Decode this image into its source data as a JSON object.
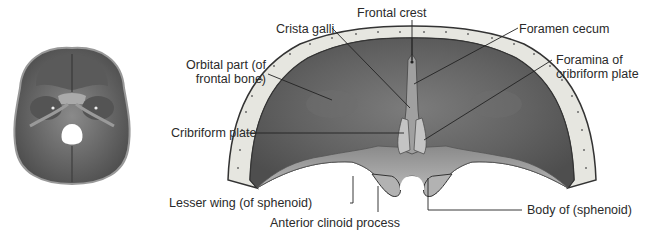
{
  "figure": {
    "thumbnail": {
      "name": "Cranial base overview (superior view of skull interior)"
    },
    "labels": {
      "frontal_crest": "Frontal crest",
      "crista_galli": "Crista galli",
      "foramen_cecum": "Foramen cecum",
      "orbital_part": "Orbital part (of\nfrontal bone)",
      "foramina_cribriform": "Foramina of\ncribriform plate",
      "cribriform_plate": "Cribriform plate",
      "lesser_wing": "Lesser wing (of sphenoid)",
      "anterior_clinoid": "Anterior clinoid process",
      "body_sphenoid": "Body of (sphenoid)"
    },
    "colors": {
      "bone_dark": "#5e5e5e",
      "bone_mid": "#7a7a7a",
      "bone_light": "#b8b8b8",
      "diploe": "#e6e6e0",
      "outline": "#333333",
      "leader": "#222222",
      "text": "#2a2a2a"
    }
  }
}
